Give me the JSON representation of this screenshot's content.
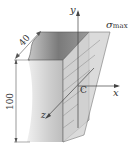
{
  "figure": {
    "labels": {
      "y_axis": "y",
      "x_axis": "x",
      "z_axis": "z",
      "centroid": "C",
      "sigma": "σ",
      "sigma_sub": "max",
      "width_dim": "40",
      "height_dim": "100"
    },
    "colors": {
      "body_light": "#d9d9d9",
      "body_mid": "#bdbdbd",
      "body_dark": "#8a8a8a",
      "stress_face": "#c9c9c9",
      "line": "#555555"
    }
  }
}
